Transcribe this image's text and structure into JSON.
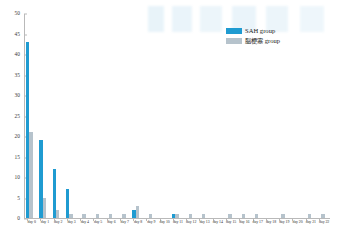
{
  "chart_data": {
    "type": "bar",
    "title": "",
    "xlabel": "",
    "ylabel": "",
    "ylim": [
      0,
      50
    ],
    "yticks": [
      0,
      5,
      10,
      15,
      20,
      25,
      30,
      35,
      40,
      45,
      50
    ],
    "grid": false,
    "legend_position": "top-right",
    "categories": [
      "day 0",
      "day 1",
      "day 2",
      "day 3",
      "day 4",
      "day 5",
      "day 6",
      "day 7",
      "day 8",
      "day 9",
      "day 10",
      "day 11",
      "day 12",
      "day 13",
      "day 14",
      "day 15",
      "day 16",
      "day 17",
      "day 18",
      "day 19",
      "day 20",
      "day 21",
      "day 22"
    ],
    "series": [
      {
        "name": "SAH group",
        "color": "#1f9bd1",
        "values": [
          43,
          19,
          12,
          7,
          0,
          0,
          0,
          0,
          2,
          0,
          0,
          1,
          0,
          0,
          0,
          0,
          0,
          0,
          0,
          0,
          0,
          0,
          0
        ]
      },
      {
        "name": "脳梗塞 group",
        "color": "#b6c3cc",
        "values": [
          21,
          5,
          2,
          1,
          1,
          1,
          1,
          1,
          3,
          1,
          0,
          1,
          1,
          1,
          0,
          1,
          1,
          1,
          0,
          1,
          0,
          1,
          1
        ]
      }
    ]
  },
  "legend": {
    "items": [
      {
        "label": "SAH group",
        "color": "#1f9bd1"
      },
      {
        "label": "脳梗塞 group",
        "color": "#b6c3cc"
      }
    ]
  },
  "axis": {
    "y_max_label": "50",
    "y_min_label": "0"
  }
}
